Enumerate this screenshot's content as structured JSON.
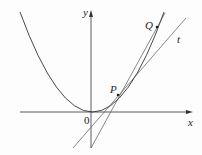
{
  "diagram": {
    "title": "",
    "labels": {
      "y_axis": "y",
      "x_axis": "x",
      "origin": "0",
      "point_p": "P",
      "point_q": "Q",
      "tangent": "t"
    },
    "colors": {
      "stroke": "#333333",
      "background": "#fdfdfd"
    },
    "elements": [
      {
        "type": "curve",
        "name": "parabola",
        "equation": "y = x^2"
      },
      {
        "type": "line",
        "name": "secant-line",
        "through": [
          "P",
          "Q"
        ]
      },
      {
        "type": "line",
        "name": "tangent-line",
        "label": "t",
        "at": "P"
      }
    ]
  }
}
